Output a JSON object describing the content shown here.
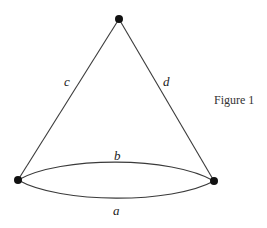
{
  "diagram": {
    "caption": "Figure 1",
    "vertices": [
      {
        "id": "top",
        "x": 119,
        "y": 19
      },
      {
        "id": "left",
        "x": 18,
        "y": 180
      },
      {
        "id": "right",
        "x": 214,
        "y": 181
      }
    ],
    "edges": [
      {
        "label": "c",
        "from": "top",
        "to": "left"
      },
      {
        "label": "d",
        "from": "top",
        "to": "right"
      },
      {
        "label": "b",
        "from": "left",
        "to": "right",
        "curve": "upper"
      },
      {
        "label": "a",
        "from": "left",
        "to": "right",
        "curve": "lower"
      }
    ],
    "labels": {
      "c": "c",
      "d": "d",
      "b": "b",
      "a": "a"
    }
  }
}
